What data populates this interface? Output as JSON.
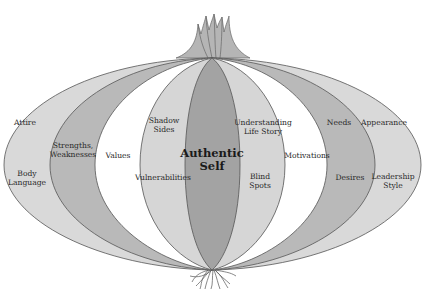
{
  "diagram": {
    "type": "onion-layers",
    "colors": {
      "outer_light": "#d9d9d9",
      "medium": "#b9b9b9",
      "white": "#ffffff",
      "inner_light": "#d6d6d6",
      "core": "#a3a3a3",
      "stroke": "#555555"
    },
    "core": {
      "label_line1": "Authentic",
      "label_line2": "Self"
    },
    "left_layers": [
      {
        "top_label": "Attire",
        "bottom_label_line1": "Body",
        "bottom_label_line2": "Language"
      },
      {
        "label_line1": "Strengths,",
        "label_line2": "Weaknesses"
      },
      {
        "label": "Values"
      },
      {
        "top_label_line1": "Shadow",
        "top_label_line2": "Sides",
        "bottom_label": "Vulnerabilities"
      }
    ],
    "right_layers": [
      {
        "top_label_line1": "Understanding",
        "top_label_line2": "Life Story",
        "bottom_label_line1": "Blind",
        "bottom_label_line2": "Spots"
      },
      {
        "label": "Motivations"
      },
      {
        "top_label": "Needs",
        "bottom_label": "Desires"
      },
      {
        "top_label": "Appearance",
        "bottom_label_line1": "Leadership",
        "bottom_label_line2": "Style"
      }
    ]
  }
}
